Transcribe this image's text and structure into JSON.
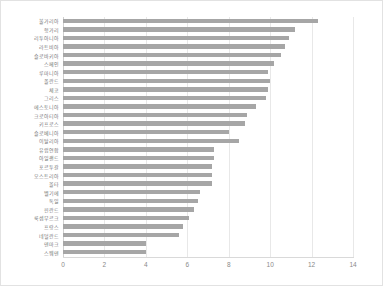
{
  "chart_data": {
    "type": "bar",
    "orientation": "horizontal",
    "title": "",
    "subtitle": "",
    "xlabel": "",
    "ylabel": "",
    "xlim": [
      0,
      14
    ],
    "ylim": null,
    "grid": true,
    "grid_axis": "x",
    "legend": false,
    "legend_position": "none",
    "bar_color": "#a6a6a6",
    "gridline_color": "#e8e8e8",
    "axis_color": "#d9d9d9",
    "tick_label_color": "#8a8a8a",
    "category_label_color": "#767676",
    "xticks": [
      0,
      2,
      4,
      6,
      8,
      10,
      12,
      14
    ],
    "xtick_labels": [
      "0",
      "2",
      "4",
      "6",
      "8",
      "10",
      "12",
      "14"
    ],
    "categories": [
      "불가리아",
      "헝가리",
      "리투아니아",
      "라트비아",
      "슬로바키아",
      "스페인",
      "루마니아",
      "폴란드",
      "체코",
      "그리스",
      "에스토니아",
      "크로아티아",
      "키프로스",
      "슬로베니아",
      "이탈리아",
      "유럽연합",
      "아일랜드",
      "포르투갈",
      "오스트리아",
      "몰타",
      "벨기에",
      "독일",
      "핀란드",
      "룩셈부르크",
      "프랑스",
      "네덜란드",
      "덴마크",
      "스웨덴"
    ],
    "values": [
      12.3,
      11.2,
      10.9,
      10.7,
      10.5,
      10.2,
      9.9,
      10.0,
      9.9,
      9.8,
      9.3,
      8.9,
      8.8,
      8.0,
      8.5,
      7.3,
      7.3,
      7.2,
      7.2,
      7.2,
      6.6,
      6.5,
      6.3,
      6.1,
      5.8,
      5.6,
      4.0,
      4.0
    ]
  }
}
